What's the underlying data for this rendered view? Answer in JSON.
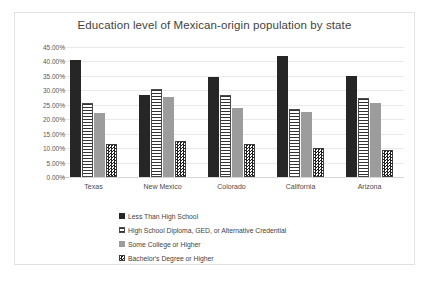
{
  "chart_data": {
    "type": "bar",
    "title": "Education level of Mexican-origin population by state",
    "xlabel": "",
    "ylabel": "",
    "ylim": [
      0,
      45
    ],
    "ytick_labels": [
      "45.00%",
      "40.00%",
      "35.00%",
      "30.00%",
      "25.00%",
      "20.00%",
      "15.00%",
      "10.00%",
      "5.00%",
      "0.00%"
    ],
    "ytick_values": [
      45,
      40,
      35,
      30,
      25,
      20,
      15,
      10,
      5,
      0
    ],
    "grid": true,
    "legend_position": "bottom",
    "categories": [
      "Texas",
      "New Mexico",
      "Colorado",
      "California",
      "Arizona"
    ],
    "series": [
      {
        "name": "Less Than High School",
        "pattern": "solid-black",
        "color": "#262626",
        "values": [
          40.5,
          28.3,
          34.7,
          42.0,
          35.0
        ]
      },
      {
        "name": "High School Diploma, GED, or Alternative Credential",
        "pattern": "horizontal-lines",
        "color": "#ffffff",
        "values": [
          25.7,
          30.5,
          28.5,
          23.6,
          27.4
        ]
      },
      {
        "name": "Some College or Higher",
        "pattern": "solid-gray",
        "color": "#9c9c9c",
        "values": [
          22.0,
          27.8,
          23.9,
          22.4,
          25.6
        ]
      },
      {
        "name": "Bachelor's Degree or Higher",
        "pattern": "checkerboard",
        "color": "#1f1f1f",
        "values": [
          11.6,
          12.4,
          11.6,
          9.9,
          9.5
        ]
      }
    ]
  }
}
